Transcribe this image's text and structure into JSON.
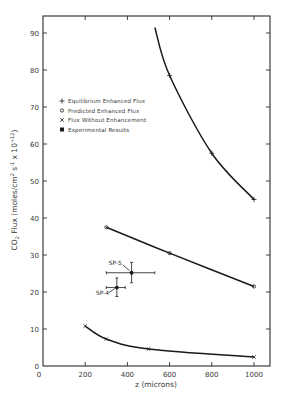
{
  "chart_data": {
    "type": "line",
    "title": "",
    "xlabel": "z (microns)",
    "ylabel": "CO2 Flux (moles/cm2 s-1 x 10+12)",
    "xlim": [
      0,
      1000
    ],
    "ylim": [
      0,
      90
    ],
    "xticks": [
      0,
      200,
      400,
      600,
      800,
      1000
    ],
    "yticks": [
      0,
      10,
      20,
      30,
      40,
      50,
      60,
      70,
      80,
      90
    ],
    "grid": false,
    "legend_position": "upper-left-inside",
    "legend": [
      {
        "marker": "+",
        "label": "Equilibrium Enhanced Flux"
      },
      {
        "marker": "o",
        "label": "Predicted Enhanced Flux"
      },
      {
        "marker": "x",
        "label": "Flux Without Enhancement"
      },
      {
        "marker": "filled-circle",
        "label": "Experimental Results"
      }
    ],
    "series": [
      {
        "name": "Equilibrium Enhanced Flux",
        "marker": "+",
        "x": [
          600,
          800,
          1000
        ],
        "y": [
          78.5,
          57.5,
          45
        ],
        "curve_start": {
          "x": 530,
          "y": 91.5
        }
      },
      {
        "name": "Predicted Enhanced Flux",
        "marker": "o",
        "x": [
          300,
          600,
          1000
        ],
        "y": [
          37.5,
          30.5,
          21.5
        ]
      },
      {
        "name": "Flux Without Enhancement",
        "marker": "x",
        "x": [
          200,
          300,
          500,
          1000
        ],
        "y": [
          10.8,
          7.3,
          4.6,
          2.4
        ]
      },
      {
        "name": "Experimental Results",
        "marker": "filled-circle",
        "points": [
          {
            "label": "SP-5",
            "x": 420,
            "y": 25.2,
            "x_err": [
              300,
              530
            ],
            "y_err": [
              22.5,
              28
            ]
          },
          {
            "label": "SP-4",
            "x": 350,
            "y": 21.2,
            "x_err": [
              300,
              390
            ],
            "y_err": [
              18.8,
              23.8
            ]
          }
        ]
      }
    ]
  },
  "labels": {
    "x_title": "z (microns)",
    "y_title_main": "CO",
    "y_title_sub": "2",
    "y_title_rest": " Flux (moles/cm",
    "y_title_sup1": "2",
    "y_title_rest2": " s",
    "y_title_sup2": "-1",
    "y_title_rest3": " x 10",
    "y_title_sup3": "+12",
    "y_title_end": ")"
  }
}
